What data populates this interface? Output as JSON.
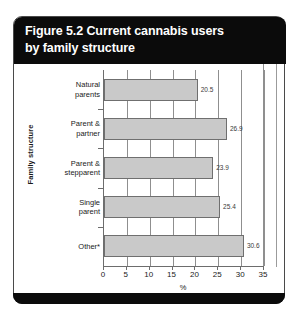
{
  "figure": {
    "title_lines": [
      "Figure 5.2 Current cannabis users",
      "by family structure"
    ]
  },
  "chart_data": {
    "type": "bar",
    "orientation": "horizontal",
    "title": "Figure 5.2 Current cannabis users by family structure",
    "categories": [
      "Natural parents",
      "Parent & partner",
      "Parent & stepparent",
      "Single parent",
      "Other*"
    ],
    "category_lines": [
      [
        "Natural",
        "parents"
      ],
      [
        "Parent &",
        "partner"
      ],
      [
        "Parent &",
        "stepparent"
      ],
      [
        "Single",
        "parent"
      ],
      [
        "Other*"
      ]
    ],
    "values": [
      20.5,
      26.9,
      23.9,
      25.4,
      30.6
    ],
    "value_labels": [
      "20.5",
      "26.9",
      "23.9",
      "25.4",
      "30.6"
    ],
    "xlabel": "%",
    "ylabel": "Family structure",
    "xlim": [
      0,
      35
    ],
    "xticks": [
      0,
      5,
      10,
      15,
      20,
      25,
      30,
      35
    ],
    "xtick_labels": [
      "0",
      "5",
      "10",
      "15",
      "20",
      "25",
      "30",
      "35"
    ],
    "grid": "vertical",
    "legend": "none",
    "bar_color": "#c9c9c9",
    "bar_border_color": "#6f6f6f"
  }
}
